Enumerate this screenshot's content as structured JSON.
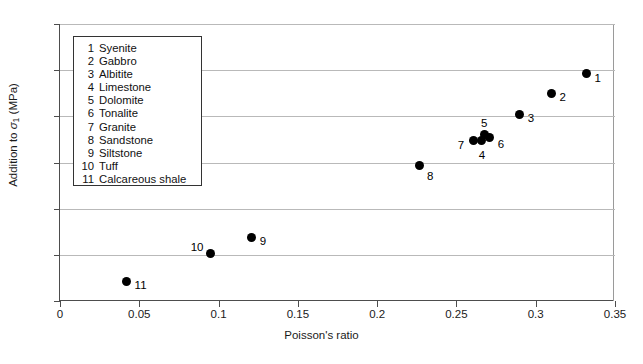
{
  "chart_data": {
    "type": "scatter",
    "title": "",
    "xlabel": "Poisson's ratio",
    "ylabel": "Addition to σ₁ (MPa)",
    "xlim": [
      0,
      0.35
    ],
    "ylim": [
      0,
      12
    ],
    "xticks": [
      "0",
      "0.05",
      "0.1",
      "0.15",
      "0.2",
      "0.25",
      "0.3",
      "0.35"
    ],
    "xtick_values": [
      0,
      0.05,
      0.1,
      0.15,
      0.2,
      0.25,
      0.3,
      0.35
    ],
    "yticks": [
      "0",
      "2",
      "4",
      "6",
      "8",
      "10",
      "12"
    ],
    "ytick_values": [
      0,
      2,
      4,
      6,
      8,
      10,
      12
    ],
    "grid": "horizontal",
    "legend_position": "top-left",
    "marker_color": "#000000",
    "points": [
      {
        "key": "1",
        "name": "Syenite",
        "x": 0.332,
        "y": 9.85,
        "label_dx": 8,
        "label_dy": -1
      },
      {
        "key": "2",
        "name": "Gabbro",
        "x": 0.31,
        "y": 9.0,
        "label_dx": 8,
        "label_dy": -1
      },
      {
        "key": "3",
        "name": "Albitite",
        "x": 0.29,
        "y": 8.1,
        "label_dx": 8,
        "label_dy": -1
      },
      {
        "key": "4",
        "name": "Limestone",
        "x": 0.266,
        "y": 6.95,
        "label_dx": -3,
        "label_dy": 9
      },
      {
        "key": "5",
        "name": "Dolomite",
        "x": 0.268,
        "y": 7.2,
        "label_dx": -4,
        "label_dy": -17
      },
      {
        "key": "6",
        "name": "Tonalite",
        "x": 0.271,
        "y": 7.1,
        "label_dx": 8,
        "label_dy": 2
      },
      {
        "key": "7",
        "name": "Granite",
        "x": 0.261,
        "y": 6.95,
        "label_dx": -16,
        "label_dy": -1
      },
      {
        "key": "8",
        "name": "Sandstone",
        "x": 0.227,
        "y": 5.85,
        "label_dx": 7,
        "label_dy": 5
      },
      {
        "key": "9",
        "name": "Siltstone",
        "x": 0.121,
        "y": 2.75,
        "label_dx": 8,
        "label_dy": -2
      },
      {
        "key": "10",
        "name": "Tuff",
        "x": 0.095,
        "y": 2.05,
        "label_dx": -20,
        "label_dy": -12
      },
      {
        "key": "11",
        "name": "Calcareous shale",
        "x": 0.042,
        "y": 0.85,
        "label_dx": 8,
        "label_dy": -1
      }
    ]
  },
  "legend": {
    "entries": [
      {
        "key": "1",
        "name": "Syenite"
      },
      {
        "key": "2",
        "name": "Gabbro"
      },
      {
        "key": "3",
        "name": "Albitite"
      },
      {
        "key": "4",
        "name": "Limestone"
      },
      {
        "key": "5",
        "name": "Dolomite"
      },
      {
        "key": "6",
        "name": "Tonalite"
      },
      {
        "key": "7",
        "name": "Granite"
      },
      {
        "key": "8",
        "name": "Sandstone"
      },
      {
        "key": "9",
        "name": "Siltstone"
      },
      {
        "key": "10",
        "name": "Tuff"
      },
      {
        "key": "11",
        "name": "Calcareous shale"
      }
    ]
  },
  "axes": {
    "x_title": "Poisson's ratio",
    "y_title_prefix": "Addition to ",
    "y_title_symbol": "σ",
    "y_title_subscript": "1",
    "y_title_suffix": " (MPa)"
  }
}
